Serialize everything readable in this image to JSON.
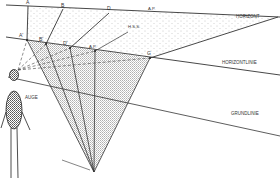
{
  "diagram": {
    "labels": {
      "A": "A",
      "B": "B",
      "D": "D",
      "AP_top": "A.P.",
      "HSS": "H.S.S.",
      "A_prime": "A'",
      "B_prime": "B'",
      "D_prime": "D'",
      "AP_mid": "A.P.",
      "G": "G",
      "horizont": "HORIZONT",
      "horizontlinie": "HORIZONTLINIE",
      "grundlinie": "GRUNDLINIE",
      "auge": "AUGE"
    },
    "colors": {
      "line": "#333333",
      "dots": "#999999",
      "hatch": "#888888"
    }
  }
}
